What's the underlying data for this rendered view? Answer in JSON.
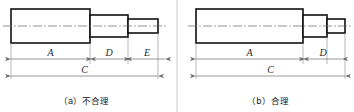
{
  "figure": {
    "type": "engineering-drawing",
    "panels": [
      {
        "id": "a",
        "caption": "（a）不合理",
        "caption_index": "（a）",
        "caption_text": "不合理",
        "dimension_labels": [
          "A",
          "D",
          "E",
          "C"
        ],
        "chained_dimensions": [
          "A",
          "D",
          "E"
        ],
        "overall_dimension": "C",
        "step_count": 3
      },
      {
        "id": "b",
        "caption": "（b）合理",
        "caption_index": "（b）",
        "caption_text": "合理",
        "dimension_labels": [
          "A",
          "D",
          "C"
        ],
        "chained_dimensions": [
          "A",
          "D"
        ],
        "overall_dimension": "C",
        "step_count": 3
      }
    ],
    "colors": {
      "outline": "#111111",
      "dimension_line": "#6e6e6e",
      "extension_line": "#8a8a8a",
      "centerline": "#666666",
      "background": "#ffffff",
      "caption_text": "#1a1a1a"
    },
    "labels": {
      "a_A": "A",
      "a_D": "D",
      "a_E": "E",
      "a_C": "C",
      "b_A": "A",
      "b_D": "D",
      "b_C": "C"
    }
  }
}
